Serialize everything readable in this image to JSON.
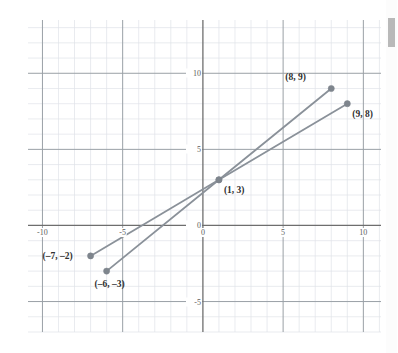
{
  "chart_data": {
    "type": "line",
    "title": "",
    "xlabel": "",
    "ylabel": "",
    "xlim": [
      -10.9,
      11.1
    ],
    "ylim": [
      -7.0,
      13.5
    ],
    "grid": true,
    "minor_grid_step": 1,
    "major_grid_step": 5,
    "legend": "none",
    "x_ticks": [
      {
        "value": -10,
        "label": "-10"
      },
      {
        "value": -5,
        "label": "-5"
      },
      {
        "value": 0,
        "label": "0"
      },
      {
        "value": 5,
        "label": "5"
      },
      {
        "value": 10,
        "label": "10"
      }
    ],
    "y_ticks": [
      {
        "value": 10,
        "label": "10"
      },
      {
        "value": 5,
        "label": "5"
      },
      {
        "value": 0,
        "label": "0"
      },
      {
        "value": -5,
        "label": "-5"
      }
    ],
    "series": [
      {
        "name": "line-a",
        "color": "#8a9199",
        "points": [
          {
            "x": -7,
            "y": -2,
            "label": "(–7, –2)"
          },
          {
            "x": 1,
            "y": 3,
            "label": "(1, 3)"
          },
          {
            "x": 9,
            "y": 8,
            "label": "(9, 8)"
          }
        ]
      },
      {
        "name": "line-b",
        "color": "#8a9199",
        "points": [
          {
            "x": -6,
            "y": -3,
            "label": "(–6, –3)"
          },
          {
            "x": 1,
            "y": 3,
            "label": "(1, 3)"
          },
          {
            "x": 8,
            "y": 9,
            "label": "(8, 9)"
          }
        ]
      }
    ],
    "annotations": [
      {
        "name": "label-8-9",
        "text": "(8, 9)",
        "x": 8,
        "y": 9,
        "anchor": "left-above"
      },
      {
        "name": "label-9-8",
        "text": "(9, 8)",
        "x": 9,
        "y": 8,
        "anchor": "right-below"
      },
      {
        "name": "label-1-3",
        "text": "(1, 3)",
        "x": 1,
        "y": 3,
        "anchor": "right-below"
      },
      {
        "name": "label-n7-n2",
        "text": "(–7, –2)",
        "x": -7,
        "y": -2,
        "anchor": "left"
      },
      {
        "name": "label-n6-n3",
        "text": "(–6, –3)",
        "x": -6,
        "y": -3,
        "anchor": "below"
      }
    ],
    "colors": {
      "line": "#8a9199",
      "marker": "#7e858d",
      "axis": "#6e6e6e",
      "major_grid": "#9aa0a6",
      "minor_grid": "#dfe3e8",
      "tick_text": "#5c5c5c",
      "label_text": "#2f2f2f",
      "background": "#ffffff"
    }
  },
  "scrollbar": {
    "name": "vertical-scrollbar",
    "thumb_color": "#b9b9b9",
    "track_color": "#fcfcfc"
  }
}
